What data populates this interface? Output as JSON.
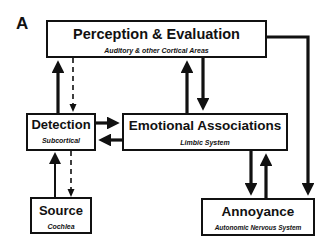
{
  "figure": {
    "panel_label": "A"
  },
  "nodes": {
    "perception": {
      "title": "Perception & Evaluation",
      "subtitle": "Auditory & other Cortical Areas"
    },
    "detection": {
      "title": "Detection",
      "subtitle": "Subcortical"
    },
    "emotional": {
      "title": "Emotional Associations",
      "subtitle": "Limbic System"
    },
    "source": {
      "title": "Source",
      "subtitle": "Cochlea"
    },
    "annoyance": {
      "title": "Annoyance",
      "subtitle": "Autonomic Nervous System"
    }
  },
  "edges": [
    {
      "from": "detection",
      "to": "perception",
      "style": "solid"
    },
    {
      "from": "perception",
      "to": "detection",
      "style": "dashed"
    },
    {
      "from": "emotional",
      "to": "perception",
      "style": "solid"
    },
    {
      "from": "perception",
      "to": "emotional",
      "style": "solid"
    },
    {
      "from": "detection",
      "to": "emotional",
      "style": "solid"
    },
    {
      "from": "emotional",
      "to": "detection",
      "style": "solid"
    },
    {
      "from": "source",
      "to": "detection",
      "style": "solid"
    },
    {
      "from": "detection",
      "to": "source",
      "style": "dashed"
    },
    {
      "from": "emotional",
      "to": "annoyance",
      "style": "solid"
    },
    {
      "from": "annoyance",
      "to": "emotional",
      "style": "solid"
    },
    {
      "from": "perception",
      "to": "annoyance",
      "style": "solid"
    }
  ],
  "colors": {
    "stroke": "#111111",
    "background": "#ffffff"
  }
}
